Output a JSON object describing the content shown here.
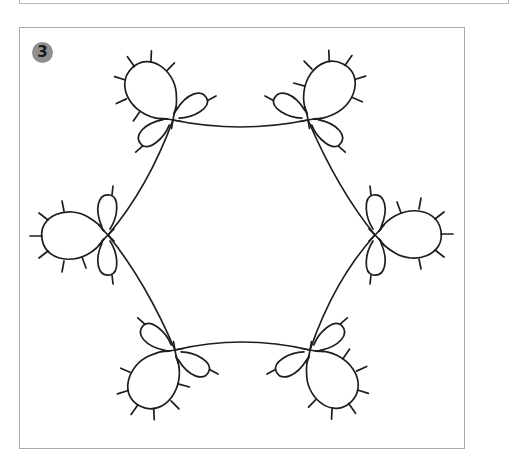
{
  "figure": {
    "step_number": "3",
    "badge_color": "#8f8f8f",
    "line_color": "#1e1e1e",
    "frame_color": "#a9a9a9",
    "motifs": [
      {
        "id": "top-left",
        "cx": 173,
        "cy": 120,
        "angle": -125
      },
      {
        "id": "top-right",
        "cx": 308,
        "cy": 120,
        "angle": -55
      },
      {
        "id": "left",
        "cx": 108,
        "cy": 235,
        "angle": 180
      },
      {
        "id": "right",
        "cx": 375,
        "cy": 235,
        "angle": 0
      },
      {
        "id": "bottom-left",
        "cx": 175,
        "cy": 350,
        "angle": 125
      },
      {
        "id": "bottom-right",
        "cx": 310,
        "cy": 350,
        "angle": 55
      }
    ]
  }
}
